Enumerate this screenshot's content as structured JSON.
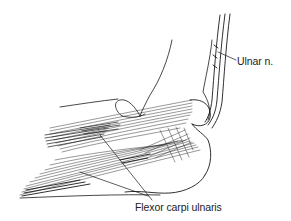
{
  "figure": {
    "labels": [
      {
        "id": "ulnar-nerve",
        "text": "Ulnar n."
      },
      {
        "id": "flexor-carpi-ulnaris",
        "text": "Flexor carpi ulnaris"
      }
    ]
  },
  "colors": {
    "ink": "#1a1a1a",
    "background": "#ffffff"
  }
}
